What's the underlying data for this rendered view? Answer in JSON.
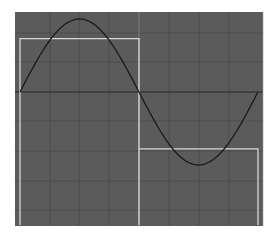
{
  "chart_data": {
    "type": "line",
    "title": "",
    "xlabel": "",
    "ylabel": "",
    "grid": true,
    "legend": null,
    "background_color": "#5a5a5a",
    "grid_color": "#4a4a4a",
    "axis_color": "#2a2a2a",
    "plot_area": {
      "left": 15,
      "top": 12,
      "right": 263,
      "bottom": 226
    },
    "x": [
      0,
      0.0625,
      0.125,
      0.1875,
      0.25,
      0.3125,
      0.375,
      0.4375,
      0.5,
      0.5625,
      0.625,
      0.6875,
      0.75,
      0.8125,
      0.875,
      0.9375,
      1.0
    ],
    "xlim": [
      0,
      1
    ],
    "ylim": [
      -1.6,
      1.0
    ],
    "series": [
      {
        "name": "sine",
        "color": "#1a1a1a",
        "values": [
          0,
          0.383,
          0.707,
          0.924,
          1.0,
          0.924,
          0.707,
          0.383,
          0,
          -0.383,
          -0.707,
          -0.924,
          -1.0,
          -0.924,
          -0.707,
          -0.383,
          0
        ]
      },
      {
        "name": "square",
        "color": "#d8d8d8",
        "values": [
          0.73,
          0.73,
          0.73,
          0.73,
          0.73,
          0.73,
          0.73,
          0.73,
          -0.78,
          -0.78,
          -0.78,
          -0.78,
          -0.78,
          -0.78,
          -0.78,
          -0.78,
          -0.78
        ]
      }
    ],
    "annotations": []
  }
}
